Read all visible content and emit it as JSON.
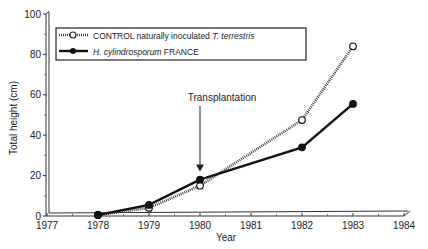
{
  "chart_data": {
    "type": "line",
    "title": "",
    "xlabel": "Year",
    "ylabel": "Total height (cm)",
    "xlim": [
      1977,
      1984
    ],
    "ylim": [
      0,
      100
    ],
    "x_ticks": [
      "1977",
      "1978",
      "1979",
      "1980",
      "1981",
      "1982",
      "1983",
      "1984"
    ],
    "y_ticks": [
      "0",
      "20",
      "40",
      "60",
      "80",
      "100"
    ],
    "grid": false,
    "legend_position": "upper-left (boxed)",
    "series": [
      {
        "name": "CONTROL naturally inoculated T. terrestris",
        "legend_plain": "CONTROL naturally inoculated ",
        "legend_italic": "T. terrestris",
        "marker": "open-circle",
        "line_style": "dotted-thick",
        "x": [
          1978,
          1979,
          1980,
          1982,
          1983
        ],
        "values": [
          0.5,
          4,
          15,
          47.5,
          84
        ]
      },
      {
        "name": "H. cylindrosporum FRANCE",
        "legend_italic": "H. cylindrosporum",
        "legend_plain": " FRANCE",
        "marker": "filled-circle",
        "line_style": "solid-thick",
        "x": [
          1978,
          1979,
          1980,
          1982,
          1983
        ],
        "values": [
          0.5,
          5.5,
          18,
          34,
          55.5
        ]
      }
    ],
    "annotations": [
      {
        "text": "Transplantation",
        "x": 1980,
        "arrow_to_value": 20
      }
    ]
  },
  "colors": {
    "ink": "#111111",
    "background": "#ffffff"
  }
}
